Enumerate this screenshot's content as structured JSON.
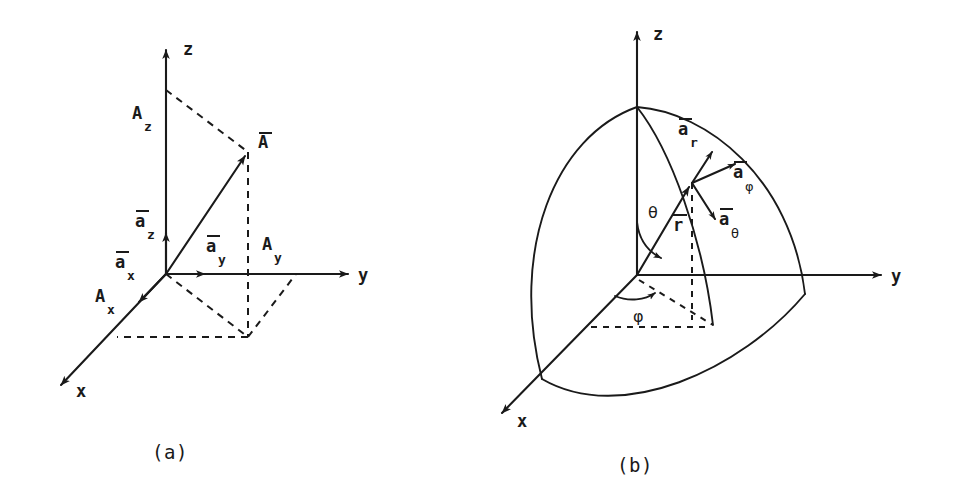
{
  "figure": {
    "type": "vector-coordinate-systems",
    "background": "#ffffff",
    "ink_color": "#1a1a1a",
    "panels": [
      {
        "id": "a",
        "caption": "(a)",
        "system": "rectangular-cartesian",
        "axes": [
          {
            "name": "z-axis",
            "label": "z",
            "direction": "up"
          },
          {
            "name": "y-axis",
            "label": "y",
            "direction": "right"
          },
          {
            "name": "x-axis",
            "label": "x",
            "direction": "lower-left"
          }
        ],
        "vectors": [
          {
            "name": "vector-A",
            "label": "A",
            "overbar": true,
            "style": "solid-arrow"
          },
          {
            "name": "unit-vector-ax",
            "label": "a",
            "subscript": "x",
            "overbar": true
          },
          {
            "name": "unit-vector-ay",
            "label": "a",
            "subscript": "y",
            "overbar": true
          },
          {
            "name": "unit-vector-az",
            "label": "a",
            "subscript": "z",
            "overbar": true
          }
        ],
        "components": [
          {
            "name": "component-Ax",
            "label": "A",
            "subscript": "x"
          },
          {
            "name": "component-Ay",
            "label": "A",
            "subscript": "y"
          },
          {
            "name": "component-Az",
            "label": "A",
            "subscript": "z"
          }
        ]
      },
      {
        "id": "b",
        "caption": "(b)",
        "system": "spherical",
        "axes": [
          {
            "name": "z-axis",
            "label": "z",
            "direction": "up"
          },
          {
            "name": "y-axis",
            "label": "y",
            "direction": "right"
          },
          {
            "name": "x-axis",
            "label": "x",
            "direction": "lower-left"
          }
        ],
        "vectors": [
          {
            "name": "position-vector-r",
            "label": "r",
            "overbar": true,
            "style": "solid-arrow"
          },
          {
            "name": "unit-vector-ar",
            "label": "a",
            "subscript": "r",
            "overbar": true
          },
          {
            "name": "unit-vector-atheta",
            "label": "a",
            "subscript": "θ",
            "overbar": true
          },
          {
            "name": "unit-vector-aphi",
            "label": "a",
            "subscript": "φ",
            "overbar": true
          }
        ],
        "angles": [
          {
            "name": "polar-angle",
            "label": "θ",
            "from": "z-axis"
          },
          {
            "name": "azimuthal-angle",
            "label": "φ",
            "from": "x-axis"
          }
        ]
      }
    ]
  },
  "labels": {
    "axis_x": "x",
    "axis_y": "y",
    "axis_z": "z",
    "vector_A": "A",
    "vector_r": "r",
    "unit_a": "a",
    "sub_x": "x",
    "sub_y": "y",
    "sub_z": "z",
    "sub_r": "r",
    "comp_A": "A",
    "theta": "θ",
    "phi": "φ",
    "caption_a": "(a)",
    "caption_b": "(b)"
  }
}
